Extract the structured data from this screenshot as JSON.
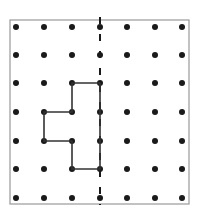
{
  "diagram": {
    "type": "dot-grid-symmetry",
    "grid": {
      "columns": 7,
      "rows": 7,
      "col_x": [
        16,
        44,
        72,
        100,
        127,
        155,
        182
      ],
      "row_y": [
        27,
        55,
        83,
        112,
        141,
        169,
        198
      ],
      "dot_radius": 3,
      "dot_color": "#1a1a1a"
    },
    "border": {
      "x": 10,
      "y": 20,
      "width": 179,
      "height": 184,
      "color": "#999999"
    },
    "symmetry_line": {
      "column": 3,
      "y_start": 17,
      "y_end": 205,
      "style": "dashed",
      "color": "#1a1a1a"
    },
    "shape": {
      "vertices": [
        [
          3,
          2
        ],
        [
          2,
          2
        ],
        [
          2,
          3
        ],
        [
          1,
          3
        ],
        [
          1,
          4
        ],
        [
          2,
          4
        ],
        [
          2,
          5
        ],
        [
          3,
          5
        ],
        [
          3,
          2
        ]
      ],
      "stroke": "#333333"
    }
  }
}
